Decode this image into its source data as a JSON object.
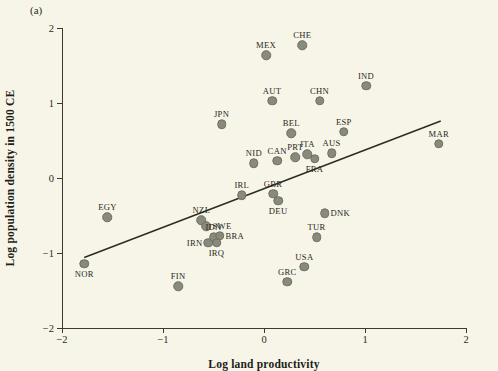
{
  "panel_label": "(a)",
  "colors": {
    "background": "#f7f5e7",
    "marker": "#8a8a7c",
    "axis": "#3a3a33",
    "trend_line": "#2b2b24",
    "text": "#28281f"
  },
  "chart_data": {
    "type": "scatter",
    "title": "",
    "xlabel": "Log land productivity",
    "ylabel": "Log population density in 1500 CE",
    "xlim": [
      -2,
      2
    ],
    "ylim": [
      -2,
      2
    ],
    "xticks": [
      "-2",
      "-1",
      "0",
      "1",
      "2"
    ],
    "xtick_values": [
      -2,
      -1,
      0,
      1,
      2
    ],
    "yticks": [
      "-2",
      "-1",
      "0",
      "1",
      "2"
    ],
    "ytick_values": [
      -2,
      -1,
      0,
      1,
      2
    ],
    "grid": false,
    "legend": null,
    "points": [
      {
        "label": "NOR",
        "x": -1.78,
        "y": -1.14,
        "label_pos": "bottom"
      },
      {
        "label": "EGY",
        "x": -1.55,
        "y": -0.52,
        "label_pos": "top"
      },
      {
        "label": "FIN",
        "x": -0.85,
        "y": -1.44,
        "label_pos": "top"
      },
      {
        "label": "NZL",
        "x": -0.62,
        "y": -0.56,
        "label_pos": "top"
      },
      {
        "label": "SWE",
        "x": -0.57,
        "y": -0.64,
        "label_pos": "right"
      },
      {
        "label": "IRN",
        "x": -0.55,
        "y": -0.86,
        "label_pos": "left"
      },
      {
        "label": "IDN",
        "x": -0.5,
        "y": -0.79,
        "label_pos": "top"
      },
      {
        "label": "IRQ",
        "x": -0.47,
        "y": -0.86,
        "label_pos": "bottom"
      },
      {
        "label": "BRA",
        "x": -0.44,
        "y": -0.77,
        "label_pos": "right"
      },
      {
        "label": "JPN",
        "x": -0.42,
        "y": 0.72,
        "label_pos": "top"
      },
      {
        "label": "IRL",
        "x": -0.22,
        "y": -0.23,
        "label_pos": "top"
      },
      {
        "label": "NID",
        "x": -0.1,
        "y": 0.2,
        "label_pos": "top"
      },
      {
        "label": "MEX",
        "x": 0.02,
        "y": 1.64,
        "label_pos": "top"
      },
      {
        "label": "AUT",
        "x": 0.08,
        "y": 1.03,
        "label_pos": "top"
      },
      {
        "label": "GBR",
        "x": 0.09,
        "y": -0.21,
        "label_pos": "top"
      },
      {
        "label": "CAN",
        "x": 0.13,
        "y": 0.23,
        "label_pos": "top"
      },
      {
        "label": "DEU",
        "x": 0.14,
        "y": -0.3,
        "label_pos": "bottom"
      },
      {
        "label": "GRC",
        "x": 0.23,
        "y": -1.38,
        "label_pos": "top"
      },
      {
        "label": "BEL",
        "x": 0.27,
        "y": 0.6,
        "label_pos": "top"
      },
      {
        "label": "PRT",
        "x": 0.31,
        "y": 0.28,
        "label_pos": "top"
      },
      {
        "label": "CHE",
        "x": 0.38,
        "y": 1.77,
        "label_pos": "top"
      },
      {
        "label": "USA",
        "x": 0.4,
        "y": -1.18,
        "label_pos": "top"
      },
      {
        "label": "ITA",
        "x": 0.43,
        "y": 0.32,
        "label_pos": "top"
      },
      {
        "label": "FRA",
        "x": 0.5,
        "y": 0.26,
        "label_pos": "bottom"
      },
      {
        "label": "TUR",
        "x": 0.52,
        "y": -0.79,
        "label_pos": "top"
      },
      {
        "label": "CHN",
        "x": 0.55,
        "y": 1.03,
        "label_pos": "top"
      },
      {
        "label": "DNK",
        "x": 0.6,
        "y": -0.47,
        "label_pos": "right"
      },
      {
        "label": "AUS",
        "x": 0.67,
        "y": 0.33,
        "label_pos": "top"
      },
      {
        "label": "ESP",
        "x": 0.79,
        "y": 0.62,
        "label_pos": "top"
      },
      {
        "label": "IND",
        "x": 1.01,
        "y": 1.23,
        "label_pos": "top"
      },
      {
        "label": "MAR",
        "x": 1.73,
        "y": 0.46,
        "label_pos": "top"
      }
    ],
    "trend_line": {
      "x0": -1.78,
      "y0": -1.06,
      "x1": 1.75,
      "y1": 0.76
    }
  }
}
